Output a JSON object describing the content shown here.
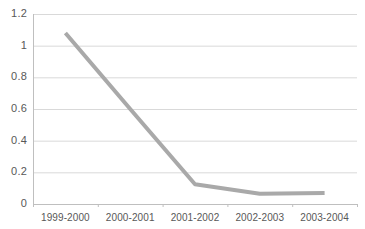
{
  "chart_data": {
    "type": "line",
    "title": "",
    "subtitle": "",
    "xlabel": "",
    "ylabel": "",
    "categories": [
      "1999-2000",
      "2000-2001",
      "2001-2002",
      "2002-2003",
      "2003-2004"
    ],
    "series": [
      {
        "name": "series-1",
        "values": [
          1.08,
          0.6,
          0.125,
          0.065,
          0.07
        ],
        "color": "#a9a9a9",
        "line_width": 4
      }
    ],
    "ylim": [
      0,
      1.2
    ],
    "yticks": [
      0,
      0.2,
      0.4,
      0.6,
      0.8,
      1,
      1.2
    ],
    "ytick_labels": [
      "0",
      "0.2",
      "0.4",
      "0.6",
      "0.8",
      "1",
      "1.2"
    ],
    "xtick_labels": [
      "1999-2000",
      "2000-2001",
      "2001-2002",
      "2002-2003",
      "2003-2004"
    ],
    "grid": true,
    "grid_axis": "y",
    "grid_color": "#d9d9d9",
    "axis_color": "#bfbfbf",
    "legend": false,
    "legend_position": "none",
    "markers": false,
    "background": "#ffffff",
    "tick_label_color": "#585858",
    "annotations": []
  },
  "plot_geometry": {
    "left": 33,
    "right": 357,
    "top": 14,
    "bottom": 204
  }
}
